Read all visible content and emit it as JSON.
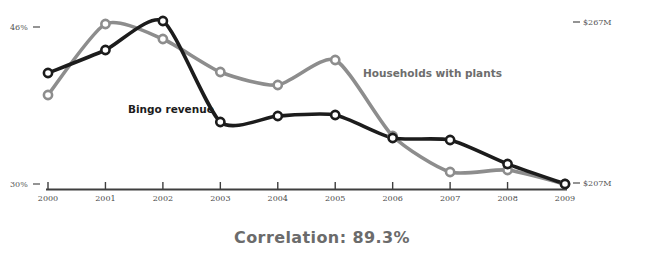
{
  "chart_data": {
    "type": "line",
    "title": "",
    "subtitle": "",
    "xlabel": "",
    "categories": [
      "2000",
      "2001",
      "2002",
      "2003",
      "2004",
      "2005",
      "2006",
      "2007",
      "2008",
      "2009"
    ],
    "grid": false,
    "legend_position": "inline-annotation",
    "series": [
      {
        "name": "Bingo revenue",
        "color": "#1c1c1c",
        "axis": "right",
        "unit": "USD millions",
        "axis_label_top": "$267M",
        "axis_label_bottom": "$207M",
        "axis_range": [
          207,
          267
        ],
        "values": [
          240,
          252,
          267,
          211,
          214,
          215,
          202,
          201,
          187,
          207
        ],
        "pixel_y": [
          73,
          50,
          21,
          122,
          116,
          115,
          138,
          140,
          164,
          184
        ]
      },
      {
        "name": "Households with plants",
        "color": "#8d8d8d",
        "axis": "left",
        "unit": "percent",
        "axis_label_top": "46%",
        "axis_label_bottom": "30%",
        "axis_range": [
          30,
          46
        ],
        "values": [
          38.9,
          45.6,
          44.1,
          41.0,
          39.7,
          42.4,
          36.4,
          32.8,
          33.0,
          30.0
        ],
        "pixel_y": [
          95,
          24,
          39,
          72,
          85,
          60,
          136,
          172,
          170,
          184
        ]
      }
    ]
  },
  "axes": {
    "left_top_label": "46%",
    "left_bottom_label": "30%",
    "right_top_label": "$267M",
    "right_bottom_label": "$207M"
  },
  "annotations": {
    "black_series_label": "Bingo revenue",
    "gray_series_label": "Households with plants"
  },
  "footer": {
    "correlation_text": "Correlation: 89.3%"
  },
  "colors": {
    "black_series": "#1c1c1c",
    "gray_series": "#8d8d8d",
    "axis": "#4a4a4a",
    "footer_text": "#6b6b6b",
    "marker_fill": "#ffffff"
  }
}
